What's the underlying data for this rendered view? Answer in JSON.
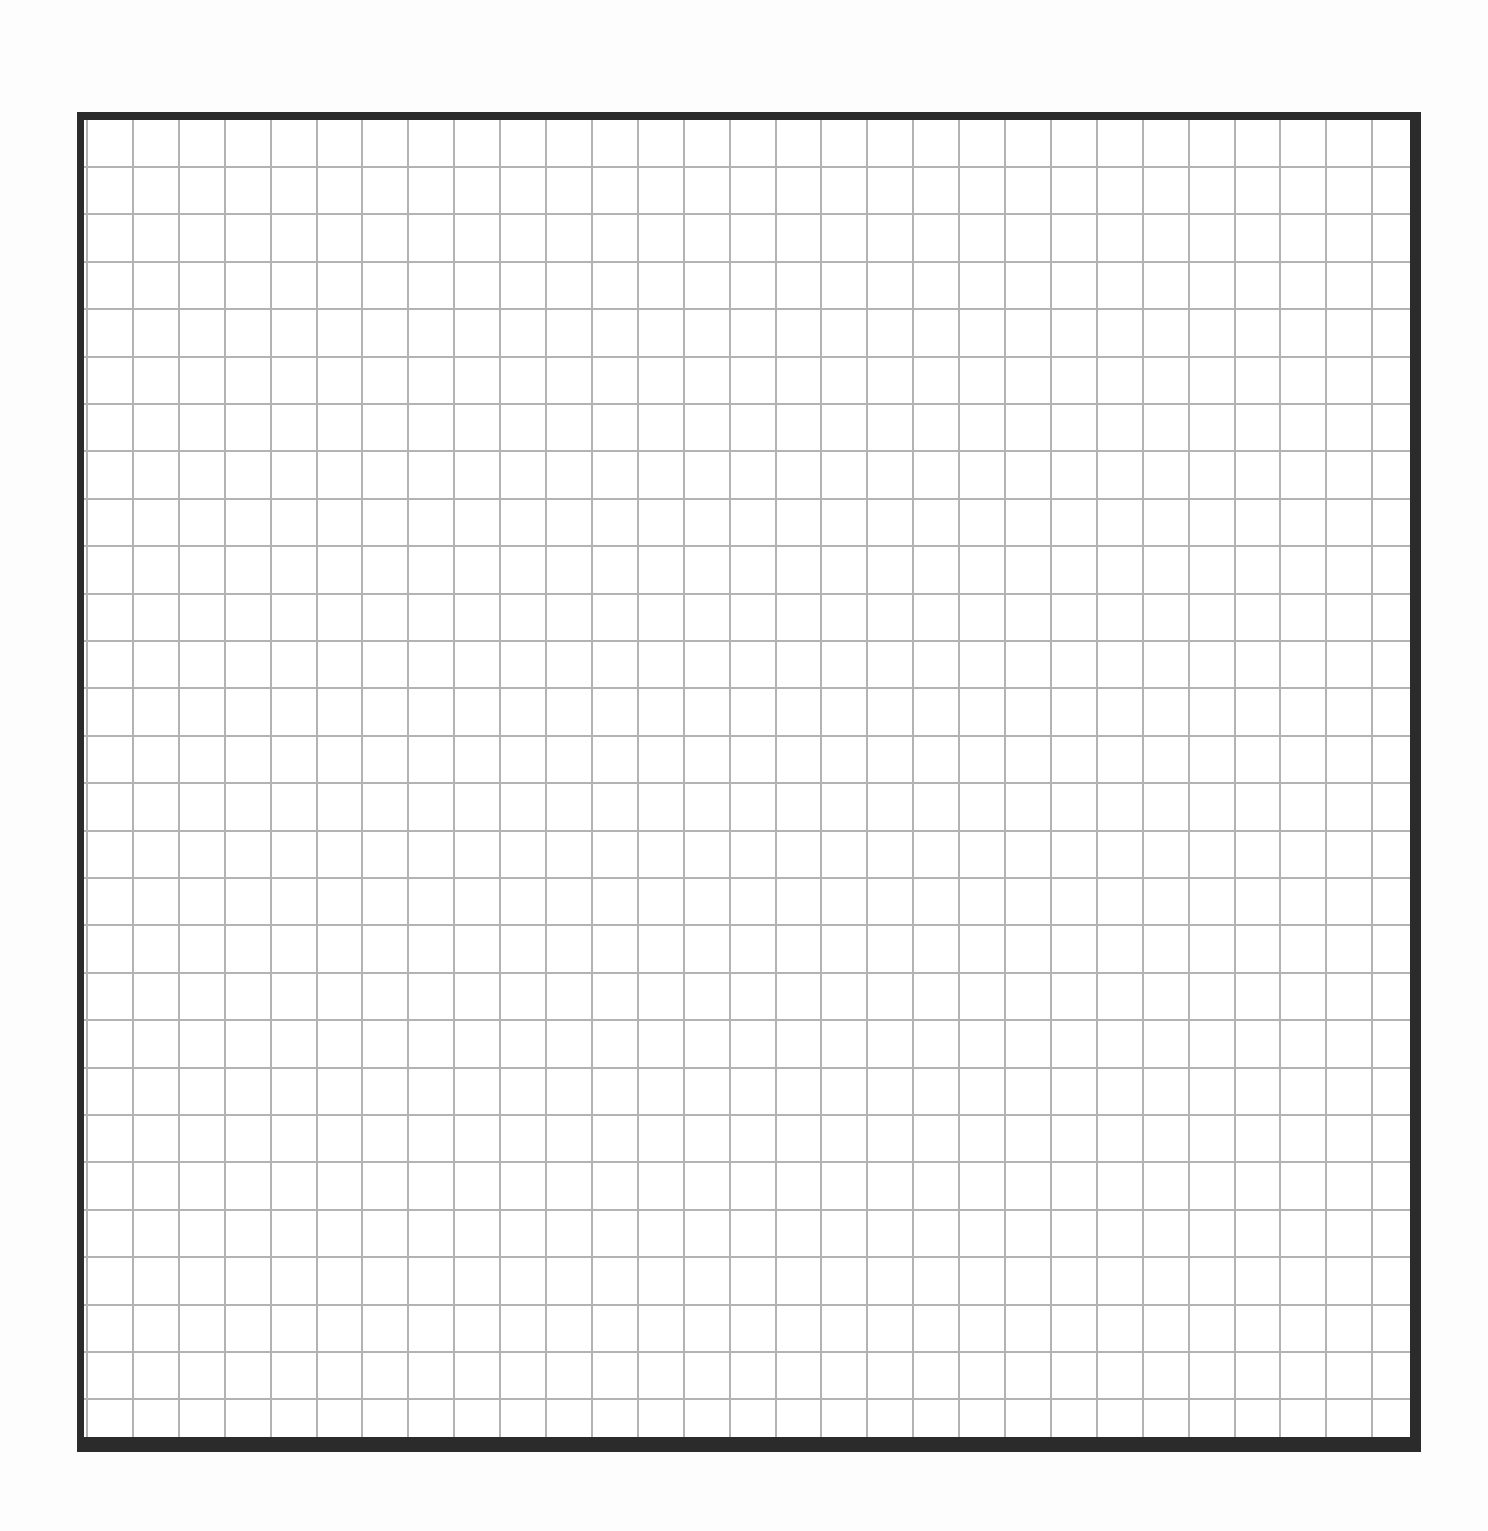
{
  "page": {
    "background_color": "#ffffff"
  },
  "frame": {
    "border_color": "#2b2b2b",
    "outer": {
      "left": 77,
      "top": 112,
      "width": 1344,
      "height": 1340
    },
    "border_widths": {
      "top": 8,
      "left": 7,
      "right": 11,
      "bottom": 15
    }
  },
  "grid": {
    "line_color": "#b3b3b3",
    "line_thickness": 2,
    "vertical_lines": {
      "count": 29,
      "first_offset": 2,
      "spacing": 45.9
    },
    "horizontal_lines": {
      "count": 27,
      "first_offset": 46,
      "spacing": 47.4
    }
  }
}
